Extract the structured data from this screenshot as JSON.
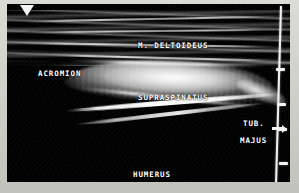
{
  "image": {
    "modality": "ultrasound-b-mode",
    "region": "shoulder",
    "border_color": "#d2d2cd",
    "scan_background": "#000000",
    "annotation_color": "#ffffff"
  },
  "annotations": [
    {
      "id": "deltoid",
      "label": "M. DELTOIDEUS"
    },
    {
      "id": "acromion",
      "label": "ACROMION"
    },
    {
      "id": "supra",
      "label": "SUPRASPINATUS"
    },
    {
      "id": "tub",
      "label": "TUB."
    },
    {
      "id": "majus",
      "label": "MAJUS"
    },
    {
      "id": "humerus",
      "label": "HUMERUS"
    }
  ],
  "scale": {
    "name": "depth-scale",
    "tick_count": 4,
    "ticks": [
      {
        "y": 64
      },
      {
        "y": 99
      },
      {
        "y": 124
      },
      {
        "y": 158
      }
    ]
  },
  "markers": {
    "apex": "apex-marker",
    "caliper": "caliper-arrow"
  }
}
